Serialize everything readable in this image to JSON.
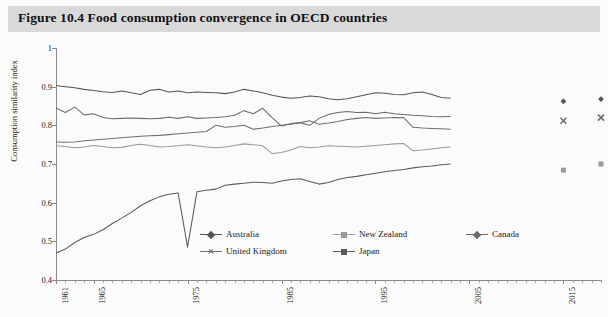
{
  "figure": {
    "number": "Figure 10.4",
    "title": "Figure 10.4  Food consumption convergence in OECD countries"
  },
  "colors": {
    "australia": "#555555",
    "new_zealand": "#9a9a9a",
    "canada": "#6b6b6b",
    "united_kingdom": "#707070",
    "japan": "#5a5a5a",
    "axis": "#8a8a8a",
    "title_bar": "#d9d9d9",
    "background": "#fbfbfb",
    "text": "#222222"
  },
  "legend": {
    "position": "bottom-inside",
    "entries": [
      {
        "label": "Australia",
        "marker": "diamond",
        "color": "#555555"
      },
      {
        "label": "New Zealand",
        "marker": "square",
        "color": "#9a9a9a"
      },
      {
        "label": "Canada",
        "marker": "diamond",
        "color": "#6b6b6b"
      },
      {
        "label": "United Kingdom",
        "marker": "x",
        "color": "#707070"
      },
      {
        "label": "Japan",
        "marker": "square",
        "color": "#5a5a5a"
      }
    ]
  },
  "chart_data": {
    "type": "line",
    "title": "Food consumption convergence in OECD countries",
    "xlabel": "",
    "ylabel": "Consumption similarity index",
    "xlim": [
      1961,
      2019
    ],
    "ylim": [
      0.4,
      1.0
    ],
    "grid": false,
    "yticks": [
      1,
      0.9,
      0.8,
      0.7,
      0.6,
      0.5,
      0.4
    ],
    "ytick_labels": [
      "1",
      "0.9",
      "0.8",
      "0.7",
      "0.6",
      "0.5",
      "0.4"
    ],
    "xticks_labeled": [
      1961,
      1965,
      1975,
      1985,
      1995,
      2005,
      2015
    ],
    "xtick_labels": [
      "1961",
      "1965",
      "1975",
      "1985",
      "1995",
      "2005",
      "2015"
    ],
    "x": [
      1961,
      1962,
      1963,
      1964,
      1965,
      1966,
      1967,
      1968,
      1969,
      1970,
      1971,
      1972,
      1973,
      1974,
      1975,
      1976,
      1977,
      1978,
      1979,
      1980,
      1981,
      1982,
      1983,
      1984,
      1985,
      1986,
      1987,
      1988,
      1989,
      1990,
      1991,
      1992,
      1993,
      1994,
      1995,
      1996,
      1997,
      1998,
      1999,
      2000,
      2001,
      2002,
      2003
    ],
    "series": [
      {
        "name": "Australia",
        "marker": "diamond",
        "color": "#555555",
        "values": [
          0.903,
          0.9,
          0.897,
          0.893,
          0.89,
          0.887,
          0.885,
          0.889,
          0.884,
          0.88,
          0.891,
          0.893,
          0.886,
          0.889,
          0.884,
          0.886,
          0.885,
          0.884,
          0.882,
          0.886,
          0.893,
          0.889,
          0.884,
          0.878,
          0.873,
          0.87,
          0.872,
          0.876,
          0.874,
          0.869,
          0.866,
          0.869,
          0.874,
          0.879,
          0.884,
          0.883,
          0.88,
          0.879,
          0.884,
          0.886,
          0.88,
          0.872,
          0.87
        ]
      },
      {
        "name": "Canada",
        "marker": "diamond",
        "color": "#6b6b6b",
        "values": [
          0.845,
          0.833,
          0.847,
          0.827,
          0.83,
          0.82,
          0.817,
          0.818,
          0.819,
          0.818,
          0.817,
          0.818,
          0.821,
          0.818,
          0.822,
          0.818,
          0.819,
          0.82,
          0.822,
          0.826,
          0.838,
          0.83,
          0.844,
          0.82,
          0.798,
          0.805,
          0.807,
          0.8,
          0.818,
          0.828,
          0.833,
          0.836,
          0.833,
          0.834,
          0.83,
          0.834,
          0.83,
          0.828,
          0.826,
          0.825,
          0.823,
          0.822,
          0.823
        ]
      },
      {
        "name": "United Kingdom",
        "marker": "x",
        "color": "#707070",
        "values": [
          0.757,
          0.756,
          0.757,
          0.76,
          0.762,
          0.764,
          0.766,
          0.768,
          0.77,
          0.772,
          0.773,
          0.774,
          0.776,
          0.778,
          0.78,
          0.782,
          0.784,
          0.8,
          0.795,
          0.797,
          0.8,
          0.79,
          0.793,
          0.797,
          0.8,
          0.803,
          0.807,
          0.812,
          0.803,
          0.806,
          0.81,
          0.815,
          0.818,
          0.82,
          0.818,
          0.819,
          0.82,
          0.82,
          0.795,
          0.793,
          0.792,
          0.791,
          0.79
        ]
      },
      {
        "name": "New Zealand",
        "marker": "square",
        "color": "#9a9a9a",
        "values": [
          0.747,
          0.745,
          0.742,
          0.744,
          0.748,
          0.745,
          0.742,
          0.743,
          0.748,
          0.751,
          0.748,
          0.744,
          0.745,
          0.747,
          0.75,
          0.747,
          0.744,
          0.742,
          0.744,
          0.748,
          0.752,
          0.75,
          0.747,
          0.727,
          0.73,
          0.736,
          0.745,
          0.742,
          0.744,
          0.747,
          0.746,
          0.745,
          0.744,
          0.746,
          0.748,
          0.75,
          0.752,
          0.753,
          0.734,
          0.736,
          0.739,
          0.742,
          0.744
        ]
      },
      {
        "name": "Japan",
        "marker": "square",
        "color": "#5a5a5a",
        "values": [
          0.47,
          0.48,
          0.497,
          0.51,
          0.518,
          0.53,
          0.546,
          0.56,
          0.575,
          0.592,
          0.605,
          0.615,
          0.622,
          0.625,
          0.485,
          0.628,
          0.632,
          0.635,
          0.645,
          0.648,
          0.65,
          0.653,
          0.652,
          0.65,
          0.656,
          0.66,
          0.662,
          0.655,
          0.648,
          0.652,
          0.66,
          0.665,
          0.668,
          0.672,
          0.676,
          0.68,
          0.683,
          0.686,
          0.69,
          0.693,
          0.695,
          0.698,
          0.7
        ]
      }
    ],
    "scatter_clusters": [
      {
        "x": 2015,
        "points": [
          {
            "series": "Australia",
            "value": 0.862,
            "marker": "diamond"
          },
          {
            "series": "United Kingdom",
            "value": 0.812,
            "marker": "x"
          },
          {
            "series": "New Zealand",
            "value": 0.684,
            "marker": "square"
          }
        ]
      },
      {
        "x": 2019,
        "points": [
          {
            "series": "Australia",
            "value": 0.868,
            "marker": "diamond"
          },
          {
            "series": "United Kingdom",
            "value": 0.82,
            "marker": "x"
          },
          {
            "series": "New Zealand",
            "value": 0.7,
            "marker": "square"
          }
        ]
      }
    ]
  }
}
